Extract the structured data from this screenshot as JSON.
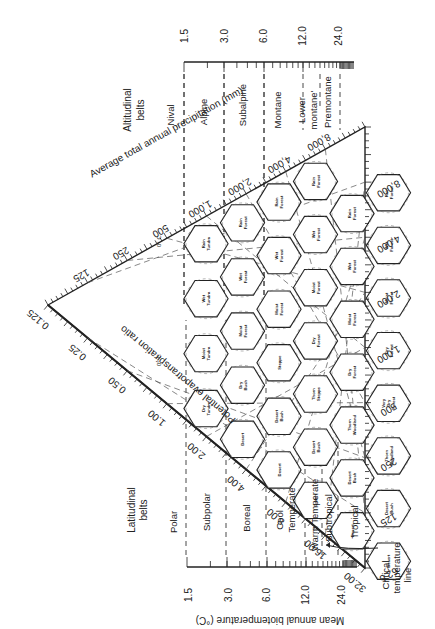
{
  "diagram": {
    "title_axis_precip": "Average total annual precipitation (mm)",
    "title_axis_pet": "Potential evapotranspiration ratio",
    "title_axis_temp": "Mean annual biotemperature (°C)",
    "altitudinal_header": [
      "Altitudinal",
      "belts"
    ],
    "latitudinal_header": [
      "Latitudinal",
      "belts"
    ],
    "critical_line_label": [
      "Critical",
      "temperature",
      "line"
    ],
    "zero_c_label": "0° C",
    "temp_ticks_top": [
      "1.5",
      "3.0",
      "6.0",
      "12.0",
      "24.0"
    ],
    "temp_ticks_bottom": [
      "1.5",
      "3.0",
      "6.0",
      "12.0",
      "24.0"
    ],
    "altitudinal_belts": [
      "Nival",
      "Alpine",
      "Subalpine",
      "Montane",
      "Lower montane",
      "Premontane"
    ],
    "latitudinal_belts": [
      "Polar",
      "Subpolar",
      "Boreal",
      "Cool Temperate",
      "Warm Temperate",
      "Subtropical",
      "Tropical"
    ],
    "precip_ticks_left": [
      "125",
      "250",
      "500",
      "1,000",
      "2,000",
      "4,000",
      "8,000"
    ],
    "precip_ticks_right": [
      "8,000",
      "4,000",
      "2,000",
      "1,000",
      "500",
      "250",
      "125",
      "62.5"
    ],
    "pet_ticks": [
      "0.125",
      "0.25",
      "0.50",
      "1.00",
      "2.00",
      "4.00",
      "8.00",
      "16.00",
      "32.00"
    ],
    "hexagons": [
      {
        "row": 0,
        "col": 0,
        "label": [
          "Dry",
          "Tundra"
        ]
      },
      {
        "row": 0,
        "col": 1,
        "label": [
          "Moist",
          "Tundra"
        ]
      },
      {
        "row": 0,
        "col": 2,
        "label": [
          "Wet",
          "Tundra"
        ]
      },
      {
        "row": 0,
        "col": 3,
        "label": [
          "Rain",
          "Tundra"
        ]
      },
      {
        "row": 1,
        "col": 0,
        "label": [
          "Desert"
        ]
      },
      {
        "row": 1,
        "col": 1,
        "label": [
          "Dry",
          "Bush"
        ]
      },
      {
        "row": 1,
        "col": 2,
        "label": [
          "Moist",
          "Forest"
        ]
      },
      {
        "row": 1,
        "col": 3,
        "label": [
          "Wet",
          "Forest"
        ]
      },
      {
        "row": 1,
        "col": 4,
        "label": [
          "Rain",
          "Forest"
        ]
      },
      {
        "row": 2,
        "col": 0,
        "label": [
          "Desert"
        ]
      },
      {
        "row": 2,
        "col": 1,
        "label": [
          "Desert",
          "Bush"
        ]
      },
      {
        "row": 2,
        "col": 2,
        "label": [
          "Steppe"
        ]
      },
      {
        "row": 2,
        "col": 3,
        "label": [
          "Moist",
          "Forest"
        ]
      },
      {
        "row": 2,
        "col": 4,
        "label": [
          "Wet",
          "Forest"
        ]
      },
      {
        "row": 2,
        "col": 5,
        "label": [
          "Rain",
          "Forest"
        ]
      },
      {
        "row": 3,
        "col": 0,
        "label": [
          "Desert"
        ]
      },
      {
        "row": 3,
        "col": 1,
        "label": [
          "Desert",
          "Bush"
        ]
      },
      {
        "row": 3,
        "col": 2,
        "label": [
          "Thorn",
          "Steppe"
        ]
      },
      {
        "row": 3,
        "col": 3,
        "label": [
          "Dry",
          "Forest"
        ]
      },
      {
        "row": 3,
        "col": 4,
        "label": [
          "Moist",
          "Forest"
        ]
      },
      {
        "row": 3,
        "col": 5,
        "label": [
          "Wet",
          "Forest"
        ]
      },
      {
        "row": 3,
        "col": 6,
        "label": [
          "Rain",
          "Forest"
        ]
      },
      {
        "row": 4,
        "col": 0,
        "label": [
          "Desert"
        ]
      },
      {
        "row": 4,
        "col": 1,
        "label": [
          "Desert",
          "Bush"
        ]
      },
      {
        "row": 4,
        "col": 2,
        "label": [
          "Thorn",
          "Woodland"
        ]
      },
      {
        "row": 4,
        "col": 3,
        "label": [
          "Dry",
          "Forest"
        ]
      },
      {
        "row": 4,
        "col": 4,
        "label": [
          "Moist",
          "Forest"
        ]
      },
      {
        "row": 4,
        "col": 5,
        "label": [
          "Wet",
          "Forest"
        ]
      },
      {
        "row": 4,
        "col": 6,
        "label": [
          "Rain",
          "Forest"
        ]
      },
      {
        "row": 5,
        "col": 0,
        "label": [
          "Desert"
        ]
      },
      {
        "row": 5,
        "col": 1,
        "label": [
          "Desert",
          "Bush"
        ]
      },
      {
        "row": 5,
        "col": 2,
        "label": [
          "Thorn",
          "Woodland"
        ]
      },
      {
        "row": 5,
        "col": 3,
        "label": [
          "Very",
          "Dry",
          "Forest"
        ]
      },
      {
        "row": 5,
        "col": 4,
        "label": [
          "Dry",
          "Forest"
        ]
      },
      {
        "row": 5,
        "col": 5,
        "label": [
          "Moist",
          "Forest"
        ]
      },
      {
        "row": 5,
        "col": 6,
        "label": [
          "Wet",
          "Forest"
        ]
      },
      {
        "row": 5,
        "col": 7,
        "label": [
          "Rain",
          "Forest"
        ]
      }
    ]
  }
}
